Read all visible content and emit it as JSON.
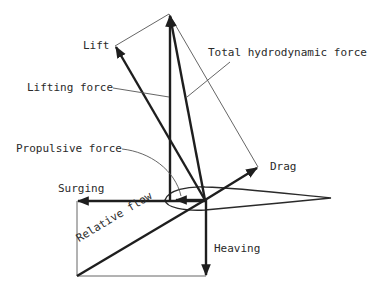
{
  "diagram": {
    "labels": {
      "lift": "Lift",
      "total_hydrodynamic_force": "Total hydrodynamic force",
      "lifting_force": "Lifting force",
      "propulsive_force": "Propulsive force",
      "drag": "Drag",
      "surging": "Surging",
      "relative_flow": "Relative flow",
      "heaving": "Heaving"
    },
    "colors": {
      "line": "#1e1e1e",
      "text": "#2a2a2a",
      "background": "#ffffff"
    }
  }
}
